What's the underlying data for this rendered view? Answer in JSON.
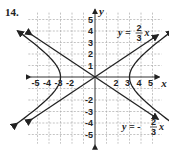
{
  "problem_number": "14.",
  "chart_data": {
    "type": "line",
    "title": "",
    "xlabel": "x",
    "ylabel": "y",
    "xlim": [
      -5,
      5
    ],
    "ylim": [
      -5,
      5
    ],
    "grid": true,
    "x_ticks": [
      "-5",
      "-4",
      "-3",
      "-2",
      "2",
      "3",
      "4",
      "5"
    ],
    "y_ticks": [
      "5",
      "4",
      "3",
      "2",
      "1",
      "-2",
      "-3",
      "-4",
      "-5"
    ],
    "series": [
      {
        "name": "hyperbola",
        "equation": "x^2/9 - y^2/4 = 1",
        "vertices": [
          [
            -3,
            0
          ],
          [
            3,
            0
          ]
        ]
      },
      {
        "name": "asymptote_pos",
        "label": "y = 2/3 x",
        "slope": 0.6667
      },
      {
        "name": "asymptote_neg",
        "label": "y = -2/3 x",
        "slope": -0.6667
      }
    ],
    "annotations": [
      "y = 2/3 x",
      "y = -2/3 x"
    ]
  },
  "labels": {
    "x_axis": "x",
    "y_axis": "y",
    "asym_pos": {
      "lhs": "y =",
      "num": "2",
      "den": "3",
      "var": "x"
    },
    "asym_neg": {
      "lhs": "y = -",
      "num": "2",
      "den": "3",
      "var": "x"
    }
  }
}
